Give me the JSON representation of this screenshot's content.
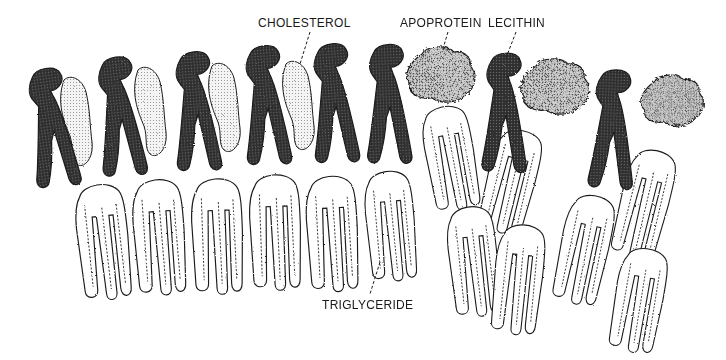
{
  "diagram": {
    "title": "",
    "type": "lipoprotein-molecular-arrangement",
    "labels": {
      "cholesterol": "CHOLESTEROL",
      "apoprotein": "APOPROTEIN",
      "lecithin": "LECITHIN",
      "triglyceride": "TRIGLYCERIDE"
    },
    "legend_colors": {
      "lecithin_fill": "#3a3a3a",
      "cholesterol_fill": "#e4e4e4",
      "apoprotein_fill": "#b5b5b5",
      "triglyceride_fill": "#ffffff",
      "outline": "#1a1a1a"
    },
    "components": {
      "lecithin_count": 9,
      "cholesterol_count": 4,
      "apoprotein_count": 3,
      "triglyceride_count": 14
    }
  }
}
